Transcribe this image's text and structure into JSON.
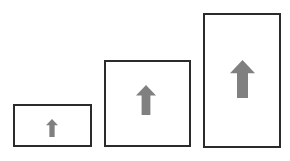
{
  "diagram": {
    "canvas": {
      "width": 290,
      "height": 161,
      "background": "#ffffff"
    },
    "style": {
      "box_border_color": "#2b2b2b",
      "box_border_width": 2,
      "box_fill": "#ffffff",
      "arrow_fill": "#808080"
    },
    "items": [
      {
        "name": "small",
        "label": "Small box with up arrow",
        "box": {
          "x": 13,
          "y": 104,
          "width": 79,
          "height": 43
        },
        "arrow": {
          "x": 46,
          "y": 119,
          "width": 12,
          "height": 18,
          "direction": "up"
        }
      },
      {
        "name": "medium",
        "label": "Medium box with up arrow",
        "box": {
          "x": 104,
          "y": 60,
          "width": 87,
          "height": 87
        },
        "arrow": {
          "x": 136,
          "y": 85,
          "width": 20,
          "height": 30,
          "direction": "up"
        }
      },
      {
        "name": "large",
        "label": "Large box with up arrow",
        "box": {
          "x": 203,
          "y": 13,
          "width": 78,
          "height": 135
        },
        "arrow": {
          "x": 230,
          "y": 60,
          "width": 25,
          "height": 38,
          "direction": "up"
        }
      }
    ]
  }
}
